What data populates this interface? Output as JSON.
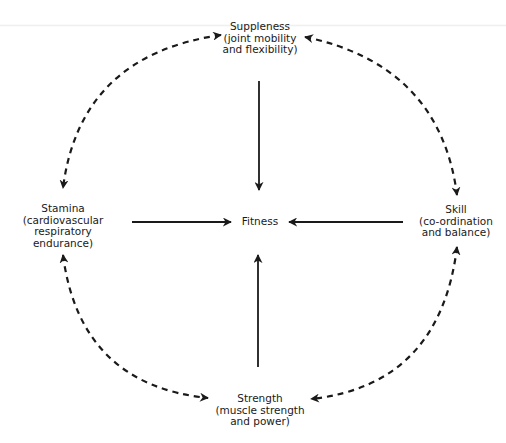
{
  "diagram": {
    "center": {
      "label": "Fitness"
    },
    "nodes": [
      {
        "id": "suppleness",
        "title": "Suppleness",
        "lines": [
          "(joint mobility",
          "and flexibility)"
        ]
      },
      {
        "id": "stamina",
        "title": "Stamina",
        "lines": [
          "(cardiovascular",
          "respiratory",
          "endurance)"
        ]
      },
      {
        "id": "skill",
        "title": "Skill",
        "lines": [
          "(co-ordination",
          "and balance)"
        ]
      },
      {
        "id": "strength",
        "title": "Strength",
        "lines": [
          "(muscle strength",
          "and power)"
        ]
      }
    ],
    "edges_solid": [
      {
        "from": "suppleness",
        "to": "fitness"
      },
      {
        "from": "stamina",
        "to": "fitness"
      },
      {
        "from": "skill",
        "to": "fitness"
      },
      {
        "from": "strength",
        "to": "fitness"
      }
    ],
    "edges_dashed_bidirectional": [
      {
        "a": "suppleness",
        "b": "stamina"
      },
      {
        "a": "suppleness",
        "b": "skill"
      },
      {
        "a": "stamina",
        "b": "strength"
      },
      {
        "a": "skill",
        "b": "strength"
      }
    ],
    "colors": {
      "line": "#1a1a1a",
      "background": "#ffffff"
    }
  }
}
